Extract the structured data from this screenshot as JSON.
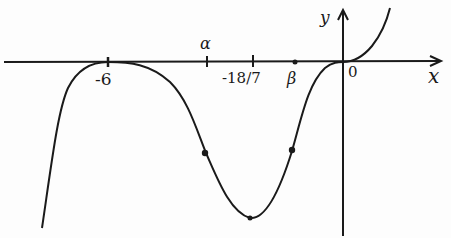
{
  "diagram": {
    "type": "hand-drawn function graph",
    "axes": {
      "x_label": "x",
      "y_label": "y",
      "origin_label": "0"
    },
    "x_ticks": [
      {
        "label": "-6",
        "meaning": "repeated root / local max touching axis"
      },
      {
        "label": "α",
        "meaning": "x-coordinate of point of inflection"
      },
      {
        "label": "-18/7",
        "meaning": "x-coordinate of local minimum"
      },
      {
        "label": "β",
        "meaning": "x-coordinate of point of inflection"
      }
    ],
    "features": [
      "curve touches x-axis at x = -6",
      "local minimum at x = -18/7",
      "points of inflection at x = α and x = β (marked with dots)",
      "stationary point of inflection at origin",
      "curve passes through origin and increases for x > 0"
    ],
    "stroke_color": "#1a1a1a"
  }
}
